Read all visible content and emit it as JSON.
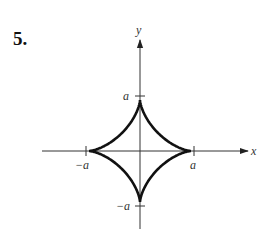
{
  "problem_number": "5.",
  "figure": {
    "type": "astroid",
    "equation_hint": "x^(2/3) + y^(2/3) = a^(2/3)",
    "axes": {
      "x_label": "x",
      "y_label": "y"
    },
    "tick_labels": {
      "x_pos": "a",
      "x_neg": "−a",
      "y_pos": "a",
      "y_neg": "−a"
    }
  }
}
